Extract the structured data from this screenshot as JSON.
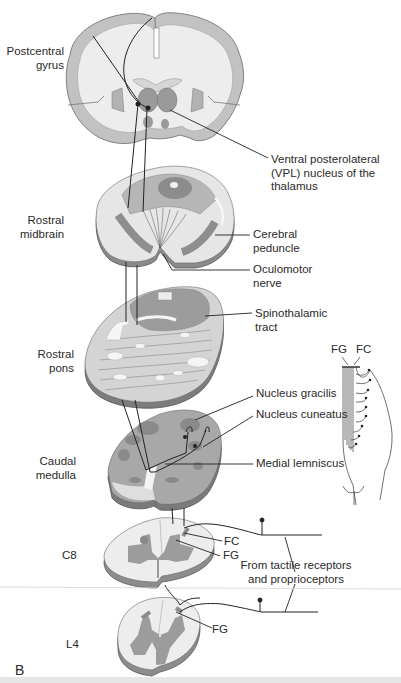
{
  "figure": {
    "panel_label": "B"
  },
  "levels": [
    {
      "id": "cortex",
      "label_lines": [
        "Postcentral",
        "gyrus"
      ]
    },
    {
      "id": "midbrain",
      "label_lines": [
        "Rostral",
        "midbrain"
      ]
    },
    {
      "id": "pons",
      "label_lines": [
        "Rostral",
        "pons"
      ]
    },
    {
      "id": "medulla",
      "label_lines": [
        "Caudal",
        "medulla"
      ]
    },
    {
      "id": "c8",
      "label_lines": [
        "C8"
      ]
    },
    {
      "id": "l4",
      "label_lines": [
        "L4"
      ]
    }
  ],
  "callouts": {
    "vpl": [
      "Ventral posterolateral",
      "(VPL) nucleus of the",
      "thalamus"
    ],
    "cerebral_peduncle": [
      "Cerebral",
      "peduncle"
    ],
    "oculomotor_nerve": [
      "Oculomotor",
      "nerve"
    ],
    "spinothalamic_tract": [
      "Spinothalamic",
      "tract"
    ],
    "nucleus_gracilis": "Nucleus gracilis",
    "nucleus_cuneatus": "Nucleus cuneatus",
    "medial_lemniscus": "Medial lemniscus",
    "c8_fc": "FC",
    "c8_fg": "FG",
    "l4_fg": "FG",
    "receptors": [
      "From tactile receptors",
      "and proprioceptors"
    ]
  },
  "inset": {
    "fg": "FG",
    "fc": "FC"
  },
  "colors": {
    "white_matter": "#ededed",
    "gray_matter": "#9a9a9a",
    "light_gray": "#c8c8c8",
    "mid_gray": "#b0b0b0",
    "outline": "#555555",
    "pathway": "#222222"
  }
}
